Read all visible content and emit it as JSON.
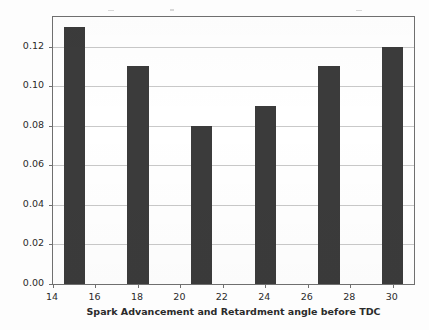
{
  "chart_data": {
    "type": "bar",
    "title": "",
    "subtitle": "",
    "xlabel": "Spark Advancement and Retardment angle before TDC",
    "ylabel": "HC Emissions (g/kWhr)",
    "categories": [
      15,
      18,
      21,
      24,
      27,
      30
    ],
    "values": [
      0.13,
      0.11,
      0.08,
      0.09,
      0.11,
      0.12
    ],
    "series": [
      {
        "name": "HC Emissions",
        "values": [
          0.13,
          0.11,
          0.08,
          0.09,
          0.11,
          0.12
        ],
        "color": "#3b3b3b"
      }
    ],
    "xlim": [
      14,
      31
    ],
    "ylim": [
      0.0,
      0.135
    ],
    "xticks": [
      14,
      16,
      18,
      20,
      22,
      24,
      26,
      28,
      30
    ],
    "xtick_labels": [
      "14",
      "16",
      "18",
      "20",
      "22",
      "24",
      "26",
      "28",
      "30"
    ],
    "yticks": [
      0.0,
      0.02,
      0.04,
      0.06,
      0.08,
      0.1,
      0.12
    ],
    "ytick_labels": [
      "0.00",
      "0.02",
      "0.04",
      "0.06",
      "0.08",
      "0.10",
      "0.12"
    ],
    "grid": "horizontal",
    "grid_color": "#c9c9c9",
    "legend": null,
    "legend_position": "none",
    "bar_width": 1.0,
    "frame_color": "#6f6f6f",
    "background_color": "#ffffff"
  }
}
